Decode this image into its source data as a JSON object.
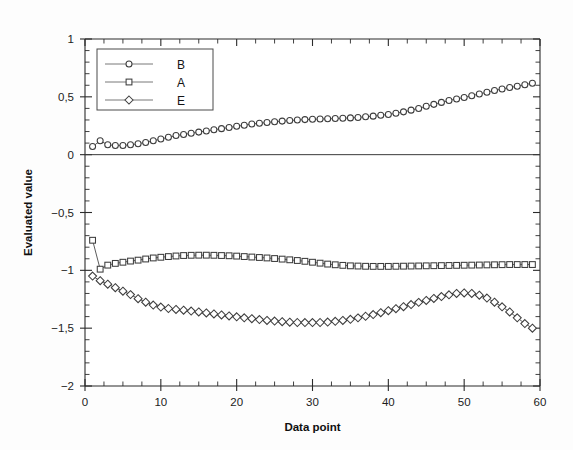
{
  "chart_data": {
    "type": "line",
    "title": "",
    "xlabel": "Data point",
    "ylabel": "Evaluated value",
    "xlim": [
      0,
      60
    ],
    "ylim": [
      -2,
      1
    ],
    "grid": false,
    "legend_position": "upper-left",
    "x_ticks": [
      "0",
      "10",
      "20",
      "30",
      "40",
      "50",
      "60"
    ],
    "x_tick_values": [
      0,
      10,
      20,
      30,
      40,
      50,
      60
    ],
    "x_minor_step": 2.5,
    "y_ticks": [
      "1",
      "0,5",
      "0",
      "-0,5",
      "-1",
      "-1,5",
      "-2"
    ],
    "y_tick_values": [
      1,
      0.5,
      0,
      -0.5,
      -1,
      -1.5,
      -2
    ],
    "y_minor_step": 0.1,
    "decimal_separator": ",",
    "x": [
      1,
      2,
      3,
      4,
      5,
      6,
      7,
      8,
      9,
      10,
      11,
      12,
      13,
      14,
      15,
      16,
      17,
      18,
      19,
      20,
      21,
      22,
      23,
      24,
      25,
      26,
      27,
      28,
      29,
      30,
      31,
      32,
      33,
      34,
      35,
      36,
      37,
      38,
      39,
      40,
      41,
      42,
      43,
      44,
      45,
      46,
      47,
      48,
      49,
      50,
      51,
      52,
      53,
      54,
      55,
      56,
      57,
      58,
      59
    ],
    "series": [
      {
        "name": "B",
        "marker": "circle",
        "values": [
          0.07,
          0.12,
          0.085,
          0.08,
          0.08,
          0.085,
          0.095,
          0.105,
          0.12,
          0.135,
          0.15,
          0.165,
          0.175,
          0.185,
          0.195,
          0.205,
          0.215,
          0.225,
          0.235,
          0.245,
          0.255,
          0.265,
          0.272,
          0.278,
          0.285,
          0.29,
          0.295,
          0.3,
          0.303,
          0.306,
          0.308,
          0.31,
          0.312,
          0.315,
          0.318,
          0.322,
          0.327,
          0.333,
          0.34,
          0.348,
          0.358,
          0.37,
          0.385,
          0.4,
          0.418,
          0.435,
          0.452,
          0.468,
          0.482,
          0.495,
          0.51,
          0.525,
          0.54,
          0.555,
          0.568,
          0.58,
          0.592,
          0.605,
          0.618
        ]
      },
      {
        "name": "A",
        "marker": "square",
        "values": [
          -0.74,
          -0.99,
          -0.955,
          -0.94,
          -0.93,
          -0.92,
          -0.912,
          -0.902,
          -0.893,
          -0.887,
          -0.881,
          -0.876,
          -0.872,
          -0.87,
          -0.869,
          -0.869,
          -0.87,
          -0.872,
          -0.874,
          -0.877,
          -0.881,
          -0.885,
          -0.889,
          -0.893,
          -0.898,
          -0.903,
          -0.909,
          -0.915,
          -0.922,
          -0.93,
          -0.938,
          -0.946,
          -0.952,
          -0.957,
          -0.961,
          -0.963,
          -0.965,
          -0.966,
          -0.966,
          -0.966,
          -0.965,
          -0.964,
          -0.963,
          -0.962,
          -0.961,
          -0.96,
          -0.959,
          -0.958,
          -0.957,
          -0.956,
          -0.955,
          -0.954,
          -0.953,
          -0.952,
          -0.951,
          -0.95,
          -0.95,
          -0.95,
          -0.95
        ]
      },
      {
        "name": "E",
        "marker": "diamond",
        "values": [
          -1.05,
          -1.09,
          -1.12,
          -1.15,
          -1.18,
          -1.21,
          -1.245,
          -1.275,
          -1.3,
          -1.318,
          -1.33,
          -1.338,
          -1.345,
          -1.352,
          -1.36,
          -1.368,
          -1.377,
          -1.386,
          -1.394,
          -1.402,
          -1.41,
          -1.418,
          -1.426,
          -1.433,
          -1.439,
          -1.444,
          -1.448,
          -1.451,
          -1.452,
          -1.452,
          -1.451,
          -1.447,
          -1.441,
          -1.433,
          -1.423,
          -1.411,
          -1.397,
          -1.382,
          -1.366,
          -1.349,
          -1.332,
          -1.314,
          -1.296,
          -1.277,
          -1.26,
          -1.243,
          -1.227,
          -1.212,
          -1.2,
          -1.195,
          -1.2,
          -1.215,
          -1.24,
          -1.275,
          -1.315,
          -1.36,
          -1.41,
          -1.46,
          -1.5
        ]
      }
    ]
  },
  "legend": {
    "entries": [
      {
        "label": "B",
        "marker": "circle"
      },
      {
        "label": "A",
        "marker": "square"
      },
      {
        "label": "E",
        "marker": "diamond"
      }
    ]
  }
}
